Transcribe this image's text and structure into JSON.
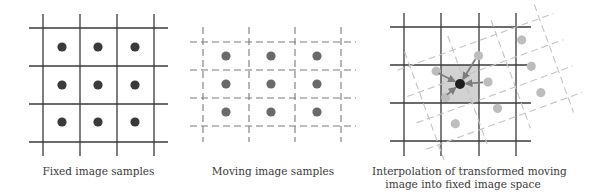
{
  "colors": {
    "background": "#ffffff",
    "fixed_grid_line": "#3a3a3a",
    "fixed_dot": "#3a3a3a",
    "moving_grid_line": "#7a7a7a",
    "moving_dot": "#6a6a6a",
    "transformed_grid_line": "#c4c4c4",
    "transformed_dot": "#bdbdbd",
    "interp_cell": "#d2d2d2",
    "arrow": "#7d7d7d",
    "target_dot": "#1e1e1e",
    "caption_text": "#3a3a3a"
  },
  "panels": [
    {
      "id": "fixed",
      "caption_lines": [
        "Fixed image samples"
      ],
      "grid": {
        "x_lines": [
          43,
          80,
          117,
          154
        ],
        "y_lines": [
          28,
          66,
          104,
          142
        ],
        "x_extent": [
          29,
          168
        ],
        "y_extent": [
          14,
          156
        ],
        "style": "solid"
      },
      "dots_x": [
        62,
        98,
        135
      ],
      "dots_y": [
        47,
        85,
        122
      ]
    },
    {
      "id": "moving",
      "caption_lines": [
        "Moving image samples"
      ],
      "grid": {
        "x_lines": [
          203,
          249,
          295,
          341
        ],
        "y_lines": [
          42,
          70,
          98,
          126
        ],
        "x_extent": [
          190,
          356
        ],
        "y_extent": [
          27,
          142
        ],
        "style": "dashed"
      },
      "dots_x": [
        226,
        271,
        317
      ],
      "dots_y": [
        56,
        84,
        112
      ]
    },
    {
      "id": "interpolation",
      "caption_lines": [
        "Interpolation of transformed moving",
        "image into fixed image space"
      ],
      "grid": {
        "x_lines": [
          404,
          441,
          479,
          516
        ],
        "y_lines": [
          27,
          65,
          103,
          141
        ],
        "x_extent": [
          390,
          531
        ],
        "y_extent": [
          13,
          156
        ],
        "style": "solid"
      },
      "transform": {
        "source_center": [
          271,
          84
        ],
        "target_center": [
          488,
          82
        ],
        "rotation_deg": -20
      },
      "interp_cell": {
        "x": 441,
        "y": 65,
        "w": 38,
        "h": 38
      },
      "target_dot": [
        460,
        84
      ],
      "arrow_sources": [
        [
          434,
          71
        ],
        [
          478,
          55
        ],
        [
          488,
          82
        ],
        [
          443,
          98
        ]
      ]
    }
  ]
}
